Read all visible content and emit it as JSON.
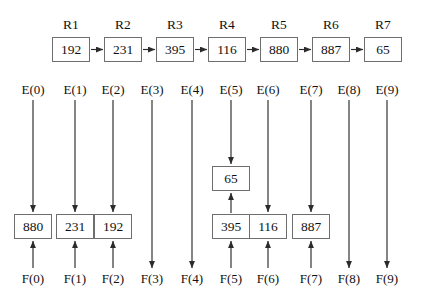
{
  "diagram": {
    "type": "diagram",
    "colors": {
      "background": "#ffffff",
      "box_border": "#6e6e6e",
      "arrow": "#2b2b2b",
      "text": "#111111"
    },
    "top_row": {
      "label_prefix": "R",
      "nodes": [
        {
          "name": "R1",
          "value": "192"
        },
        {
          "name": "R2",
          "value": "231"
        },
        {
          "name": "R3",
          "value": "395"
        },
        {
          "name": "R4",
          "value": "116"
        },
        {
          "name": "R5",
          "value": "880"
        },
        {
          "name": "R6",
          "value": "887"
        },
        {
          "name": "R7",
          "value": "65"
        }
      ],
      "connector": "right-arrow"
    },
    "columns": [
      {
        "e_label": "E(0)",
        "f_label": "F(0)",
        "lower_value": "880",
        "upper_value": null,
        "passthrough": false
      },
      {
        "e_label": "E(1)",
        "f_label": "F(1)",
        "lower_value": "231",
        "upper_value": null,
        "passthrough": false
      },
      {
        "e_label": "E(2)",
        "f_label": "F(2)",
        "lower_value": "192",
        "upper_value": null,
        "passthrough": false
      },
      {
        "e_label": "E(3)",
        "f_label": "F(3)",
        "lower_value": null,
        "upper_value": null,
        "passthrough": true
      },
      {
        "e_label": "E(4)",
        "f_label": "F(4)",
        "lower_value": null,
        "upper_value": null,
        "passthrough": true
      },
      {
        "e_label": "E(5)",
        "f_label": "F(5)",
        "lower_value": "395",
        "upper_value": "65",
        "passthrough": false
      },
      {
        "e_label": "E(6)",
        "f_label": "F(6)",
        "lower_value": "116",
        "upper_value": null,
        "passthrough": false
      },
      {
        "e_label": "E(7)",
        "f_label": "F(7)",
        "lower_value": "887",
        "upper_value": null,
        "passthrough": false
      },
      {
        "e_label": "E(8)",
        "f_label": "F(8)",
        "lower_value": null,
        "upper_value": null,
        "passthrough": true
      },
      {
        "e_label": "E(9)",
        "f_label": "F(9)",
        "lower_value": null,
        "upper_value": null,
        "passthrough": true
      }
    ]
  }
}
